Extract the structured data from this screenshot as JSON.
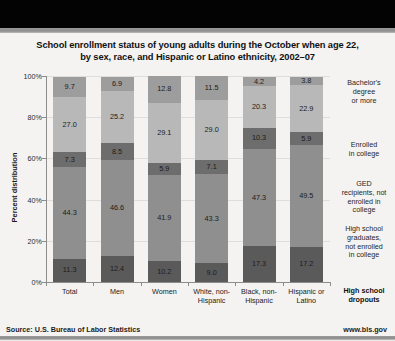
{
  "chart_data": {
    "type": "bar",
    "subtype": "stacked-100-percent",
    "title": "School enrollment status of young adults during the October when age 22, by sex, race, and Hispanic or Latino ethnicity, 2002–07",
    "title_line1": "School enrollment status of young adults during the October when age 22,",
    "title_line2": "by sex, race, and Hispanic or Latino ethnicity, 2002–07",
    "xlabel": "",
    "ylabel": "Percent distribution",
    "ylim": [
      0,
      100
    ],
    "yticks": [
      "0%",
      "20%",
      "40%",
      "60%",
      "80%",
      "100%"
    ],
    "grid": true,
    "legend_position": "right",
    "categories": [
      "Total",
      "Men",
      "Women",
      "White, non-Hispanic",
      "Black, non-Hispanic",
      "Hispanic or Latino"
    ],
    "category_labels": [
      {
        "line1": "Total",
        "line2": ""
      },
      {
        "line1": "Men",
        "line2": ""
      },
      {
        "line1": "Women",
        "line2": ""
      },
      {
        "line1": "White, non-",
        "line2": "Hispanic"
      },
      {
        "line1": "Black, non-",
        "line2": "Hispanic"
      },
      {
        "line1": "Hispanic or",
        "line2": "Latino"
      }
    ],
    "series": [
      {
        "name": "High school dropouts",
        "color": "#5a5a5a",
        "values": [
          11.3,
          12.4,
          10.2,
          9.0,
          17.3,
          17.2
        ]
      },
      {
        "name": "High school graduates, not enrolled in college",
        "color": "#8f8f8f",
        "values": [
          44.3,
          46.6,
          41.9,
          43.3,
          47.3,
          49.5
        ]
      },
      {
        "name": "GED recipients, not enrolled in college",
        "color": "#6d6d6d",
        "values": [
          7.3,
          8.5,
          5.9,
          7.1,
          10.3,
          5.9
        ]
      },
      {
        "name": "Enrolled in college",
        "color": "#b8b8b8",
        "values": [
          27.0,
          25.2,
          29.1,
          29.0,
          20.3,
          22.9
        ]
      },
      {
        "name": "Bachelor's degree or more",
        "color": "#9d9d9d",
        "values": [
          9.7,
          6.9,
          12.8,
          11.5,
          4.2,
          3.8
        ]
      }
    ],
    "legend_entries": [
      {
        "label": "Bachelor's\ndegree\nor more",
        "l1": "Bachelor's",
        "l2": "degree",
        "l3": "or more"
      },
      {
        "label": "Enrolled\nin college",
        "l1": "Enrolled",
        "l2": "in college",
        "l3": ""
      },
      {
        "label": "GED recipients, not enrolled in college",
        "l1": "GED",
        "l2": "recipients, not",
        "l3": "enrolled in",
        "l4": "college"
      },
      {
        "label": "High school graduates, not enrolled in college",
        "l1": "High school",
        "l2": "graduates,",
        "l3": "not enrolled",
        "l4": "in college"
      },
      {
        "label": "High school dropouts",
        "l1": "High school",
        "l2": "dropouts",
        "l3": ""
      }
    ]
  },
  "footer": {
    "source": "Source: U.S. Bureau of Labor Statistics",
    "url": "www.bls.gov"
  }
}
